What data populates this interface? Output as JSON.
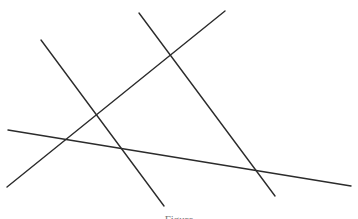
{
  "diagram": {
    "stroke_color": "#2b2b2b",
    "stroke_width": 1.4,
    "lines": [
      {
        "id": "line-a",
        "x1": 41,
        "y1": 40,
        "x2": 164,
        "y2": 206
      },
      {
        "id": "line-b",
        "x1": 7,
        "y1": 187,
        "x2": 225,
        "y2": 11
      },
      {
        "id": "line-c",
        "x1": 139,
        "y1": 13,
        "x2": 275,
        "y2": 196
      },
      {
        "id": "line-d",
        "x1": 8,
        "y1": 130,
        "x2": 351,
        "y2": 186
      }
    ]
  },
  "caption": {
    "text": "Figure"
  }
}
